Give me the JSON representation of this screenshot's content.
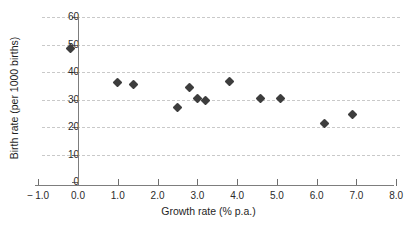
{
  "chart_data": {
    "type": "scatter",
    "title": "",
    "xlabel": "Growth rate (% p.a.)",
    "ylabel": "Birth rate (per 1000 births)",
    "xlim": [
      -1.0,
      8.0
    ],
    "ylim": [
      0,
      60
    ],
    "xticks": [
      "-1.0",
      "0.0",
      "1.0",
      "2.0",
      "3.0",
      "4.0",
      "5.0",
      "6.0",
      "7.0",
      "8.0"
    ],
    "xtick_values": [
      -1.0,
      0.0,
      1.0,
      2.0,
      3.0,
      4.0,
      5.0,
      6.0,
      7.0,
      8.0
    ],
    "yticks": [
      "0",
      "10",
      "20",
      "30",
      "40",
      "50",
      "60"
    ],
    "ytick_values": [
      0,
      10,
      20,
      30,
      40,
      50,
      60
    ],
    "grid": "horizontal-dashed",
    "legend": "none",
    "marker": "diamond",
    "marker_color": "#3d3d3d",
    "grid_color": "#c9c9c9",
    "axis_color": "#7d7d7d",
    "points": [
      {
        "x": -0.2,
        "y": 48.4
      },
      {
        "x": 1.0,
        "y": 36.2
      },
      {
        "x": 1.4,
        "y": 35.5
      },
      {
        "x": 2.5,
        "y": 27.1
      },
      {
        "x": 2.8,
        "y": 34.2
      },
      {
        "x": 3.0,
        "y": 30.3
      },
      {
        "x": 3.2,
        "y": 29.5
      },
      {
        "x": 3.8,
        "y": 36.4
      },
      {
        "x": 4.6,
        "y": 30.4
      },
      {
        "x": 5.1,
        "y": 30.4
      },
      {
        "x": 6.2,
        "y": 21.4
      },
      {
        "x": 6.9,
        "y": 24.6
      }
    ]
  }
}
